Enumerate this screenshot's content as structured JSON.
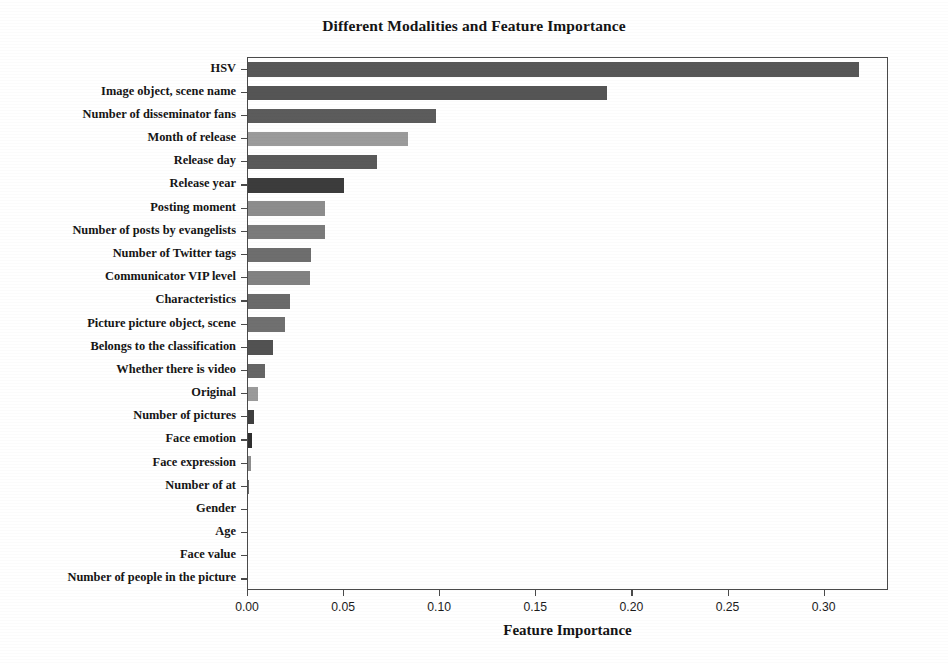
{
  "chart_data": {
    "type": "bar",
    "orientation": "horizontal",
    "title": "Different Modalities and Feature Importance",
    "xlabel": "Feature Importance",
    "ylabel": "",
    "grid": false,
    "legend": null,
    "xlim": [
      0.0,
      0.3335
    ],
    "xticks": [
      0.0,
      0.05,
      0.1,
      0.15,
      0.2,
      0.25,
      0.3
    ],
    "xticklabels": [
      "0.00",
      "0.05",
      "0.10",
      "0.15",
      "0.20",
      "0.25",
      "0.30"
    ],
    "categories": [
      "HSV",
      "Image object, scene name",
      "Number of disseminator fans",
      "Month of release",
      "Release day",
      "Release year",
      "Posting moment",
      "Number of posts by evangelists",
      "Number of Twitter tags",
      "Communicator VIP level",
      "Characteristics",
      "Picture picture object, scene",
      "Belongs to the classification",
      "Whether there is video",
      "Original",
      "Number of pictures",
      "Face emotion",
      "Face expression",
      "Number of at",
      "Gender",
      "Age",
      "Face value",
      "Number of people in the picture"
    ],
    "values": [
      0.318,
      0.187,
      0.098,
      0.083,
      0.067,
      0.05,
      0.04,
      0.04,
      0.033,
      0.032,
      0.022,
      0.019,
      0.013,
      0.009,
      0.005,
      0.003,
      0.002,
      0.0015,
      0.0005,
      0.0,
      0.0,
      0.0,
      0.0
    ],
    "bar_colors": [
      "#585858",
      "#555555",
      "#5c5c5c",
      "#9b9b9b",
      "#5a5a5a",
      "#3c3c3c",
      "#8d8d8d",
      "#7b7b7b",
      "#6e6e6e",
      "#828282",
      "#6a6a6a",
      "#707070",
      "#525252",
      "#666666",
      "#9a9a9a",
      "#3f3f3f",
      "#2e2e2e",
      "#8e8e8e",
      "#6a6a6a",
      "#6a6a6a",
      "#6a6a6a",
      "#6a6a6a",
      "#6a6a6a"
    ]
  },
  "colors": {
    "axis": "#4a4a4a",
    "text": "#151515",
    "background": "#ffffff"
  }
}
